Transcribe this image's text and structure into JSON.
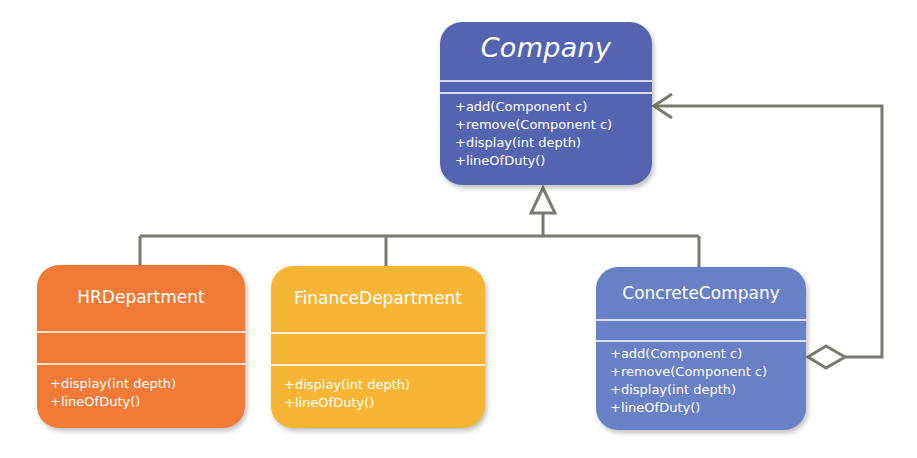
{
  "diagram": {
    "type": "UML class diagram (Composite pattern)",
    "classes": {
      "company": {
        "name": "Company",
        "abstract": true,
        "methods": [
          "+add(Component c)",
          "+remove(Component c)",
          "+display(int depth)",
          "+lineOfDuty()"
        ],
        "color": "#5564b0"
      },
      "hr": {
        "name": "HRDepartment",
        "methods": [
          "+display(int depth)",
          "+lineOfDuty()"
        ],
        "color": "#f17a36"
      },
      "finance": {
        "name": "FinanceDepartment",
        "methods": [
          "+display(int depth)",
          "+lineOfDuty()"
        ],
        "color": "#f6b535"
      },
      "concrete": {
        "name": "ConcreteCompany",
        "methods": [
          "+add(Component c)",
          "+remove(Component c)",
          "+display(int depth)",
          "+lineOfDuty()"
        ],
        "color": "#6780c6"
      }
    },
    "relationships": [
      {
        "type": "generalization",
        "from": "HRDepartment",
        "to": "Company"
      },
      {
        "type": "generalization",
        "from": "FinanceDepartment",
        "to": "Company"
      },
      {
        "type": "generalization",
        "from": "ConcreteCompany",
        "to": "Company"
      },
      {
        "type": "aggregation",
        "from": "ConcreteCompany",
        "to": "Company"
      }
    ],
    "line_color": "#7a7a6e"
  }
}
